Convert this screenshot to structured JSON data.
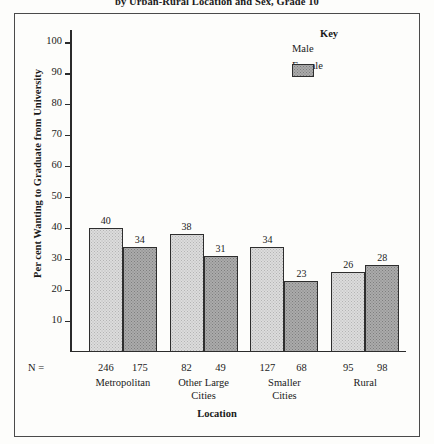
{
  "chart_data": {
    "type": "bar",
    "title": "by Urban-Rural Location and Sex, Grade 10",
    "xlabel": "Location",
    "ylabel": "Per cent Wanting to Graduate from University",
    "categories": [
      "Metropolitan",
      "Other Large\nCities",
      "Smaller\nCities",
      "Rural"
    ],
    "series": [
      {
        "name": "Male",
        "values": [
          40,
          38,
          34,
          26
        ],
        "color": "#dcdcdc"
      },
      {
        "name": "Female",
        "values": [
          34,
          31,
          23,
          28
        ],
        "color": "#ababab"
      }
    ],
    "n_label": "N =",
    "n_values": [
      {
        "group": "Metropolitan",
        "male": "246",
        "female": "175"
      },
      {
        "group": "Other Large Cities",
        "male": "82",
        "female": "49"
      },
      {
        "group": "Smaller Cities",
        "male": "127",
        "female": "68"
      },
      {
        "group": "Rural",
        "male": "95",
        "female": "98"
      }
    ],
    "yticks": [
      10,
      20,
      30,
      40,
      50,
      60,
      70,
      80,
      90,
      100
    ],
    "ytick_labels": [
      "10",
      "20",
      "30",
      "40",
      "50",
      "60",
      "70",
      "80",
      "90",
      "100"
    ],
    "ylim": [
      0,
      104
    ],
    "grid": false,
    "legend": {
      "title": "Key",
      "position": "top-right",
      "entries": [
        "Male",
        "Female"
      ]
    }
  },
  "axis_values": {
    "bar_labels": [
      "40",
      "34",
      "38",
      "31",
      "34",
      "23",
      "26",
      "28"
    ]
  }
}
